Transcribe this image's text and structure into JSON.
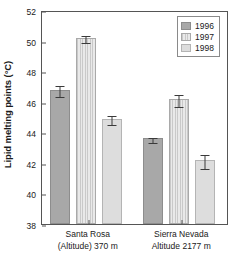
{
  "chart_data": {
    "type": "bar",
    "title": "",
    "subtitle": "",
    "xlabel": "",
    "ylabel": "Lipid melting points (°C)",
    "ylim": [
      38,
      52
    ],
    "yticks": [
      38,
      40,
      42,
      44,
      46,
      48,
      50,
      52
    ],
    "ytick_labels": [
      "38",
      "40",
      "42",
      "44",
      "46",
      "48",
      "50",
      "52"
    ],
    "grid": false,
    "legend_position": "top-right",
    "categories": [
      "Santa Rosa (Altitude) 370 m",
      "Sierra Nevada Altitude 2177 m"
    ],
    "category_labels": [
      {
        "line1": "Santa Rosa",
        "line2": "(Altitude) 370 m"
      },
      {
        "line1": "Sierra Nevada",
        "line2": "Altitude 2177 m"
      }
    ],
    "series": [
      {
        "name": "1996",
        "color": "#a8a8a8",
        "pattern": "solid",
        "values": [
          46.8,
          43.6
        ],
        "errors": [
          0.35,
          0.15
        ]
      },
      {
        "name": "1997",
        "color": "#d4d4d4",
        "pattern": "vertical-hatch",
        "values": [
          50.2,
          46.2
        ],
        "errors": [
          0.25,
          0.4
        ]
      },
      {
        "name": "1998",
        "color": "#dddddd",
        "pattern": "solid",
        "values": [
          44.9,
          42.2
        ],
        "errors": [
          0.3,
          0.45
        ]
      }
    ],
    "error_bar_type": "symmetric",
    "axis_color": "#555555",
    "text_color": "#1a1a1a"
  },
  "legend": {
    "entries": [
      {
        "label": "1996"
      },
      {
        "label": "1997"
      },
      {
        "label": "1998"
      }
    ]
  }
}
